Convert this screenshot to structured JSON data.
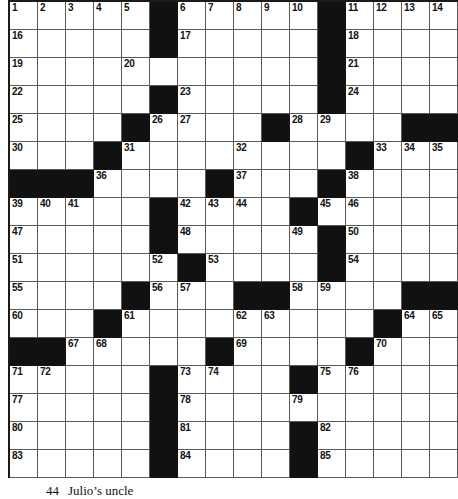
{
  "puzzle": {
    "type": "crossword-grid",
    "columns": 16,
    "rows": 17,
    "cell_px": 28,
    "colors": {
      "block": "#111111",
      "cell": "#ffffff",
      "rule": "#5a5a5a",
      "border": "#1a1a1a",
      "number_text": "#111111"
    },
    "grid": [
      [
        {
          "b": false,
          "n": "1"
        },
        {
          "b": false,
          "n": "2"
        },
        {
          "b": false,
          "n": "3"
        },
        {
          "b": false,
          "n": "4"
        },
        {
          "b": false,
          "n": "5"
        },
        {
          "b": true,
          "n": ""
        },
        {
          "b": false,
          "n": "6"
        },
        {
          "b": false,
          "n": "7"
        },
        {
          "b": false,
          "n": "8"
        },
        {
          "b": false,
          "n": "9"
        },
        {
          "b": false,
          "n": "10"
        },
        {
          "b": true,
          "n": ""
        },
        {
          "b": false,
          "n": "11"
        },
        {
          "b": false,
          "n": "12"
        },
        {
          "b": false,
          "n": "13"
        },
        {
          "b": false,
          "n": "14"
        }
      ],
      [
        {
          "b": false,
          "n": "16"
        },
        {
          "b": false,
          "n": ""
        },
        {
          "b": false,
          "n": ""
        },
        {
          "b": false,
          "n": ""
        },
        {
          "b": false,
          "n": ""
        },
        {
          "b": true,
          "n": ""
        },
        {
          "b": false,
          "n": "17"
        },
        {
          "b": false,
          "n": ""
        },
        {
          "b": false,
          "n": ""
        },
        {
          "b": false,
          "n": ""
        },
        {
          "b": false,
          "n": ""
        },
        {
          "b": true,
          "n": ""
        },
        {
          "b": false,
          "n": "18"
        },
        {
          "b": false,
          "n": ""
        },
        {
          "b": false,
          "n": ""
        },
        {
          "b": false,
          "n": ""
        }
      ],
      [
        {
          "b": false,
          "n": "19"
        },
        {
          "b": false,
          "n": ""
        },
        {
          "b": false,
          "n": ""
        },
        {
          "b": false,
          "n": ""
        },
        {
          "b": false,
          "n": "20"
        },
        {
          "b": false,
          "n": ""
        },
        {
          "b": false,
          "n": ""
        },
        {
          "b": false,
          "n": ""
        },
        {
          "b": false,
          "n": ""
        },
        {
          "b": false,
          "n": ""
        },
        {
          "b": false,
          "n": ""
        },
        {
          "b": true,
          "n": ""
        },
        {
          "b": false,
          "n": "21"
        },
        {
          "b": false,
          "n": ""
        },
        {
          "b": false,
          "n": ""
        },
        {
          "b": false,
          "n": ""
        }
      ],
      [
        {
          "b": false,
          "n": "22"
        },
        {
          "b": false,
          "n": ""
        },
        {
          "b": false,
          "n": ""
        },
        {
          "b": false,
          "n": ""
        },
        {
          "b": false,
          "n": ""
        },
        {
          "b": true,
          "n": ""
        },
        {
          "b": false,
          "n": "23"
        },
        {
          "b": false,
          "n": ""
        },
        {
          "b": false,
          "n": ""
        },
        {
          "b": false,
          "n": ""
        },
        {
          "b": false,
          "n": ""
        },
        {
          "b": true,
          "n": ""
        },
        {
          "b": false,
          "n": "24"
        },
        {
          "b": false,
          "n": ""
        },
        {
          "b": false,
          "n": ""
        },
        {
          "b": false,
          "n": ""
        }
      ],
      [
        {
          "b": false,
          "n": "25"
        },
        {
          "b": false,
          "n": ""
        },
        {
          "b": false,
          "n": ""
        },
        {
          "b": false,
          "n": ""
        },
        {
          "b": true,
          "n": ""
        },
        {
          "b": false,
          "n": "26"
        },
        {
          "b": false,
          "n": "27"
        },
        {
          "b": false,
          "n": ""
        },
        {
          "b": false,
          "n": ""
        },
        {
          "b": true,
          "n": ""
        },
        {
          "b": false,
          "n": "28"
        },
        {
          "b": false,
          "n": "29"
        },
        {
          "b": false,
          "n": ""
        },
        {
          "b": false,
          "n": ""
        },
        {
          "b": true,
          "n": ""
        },
        {
          "b": true,
          "n": ""
        }
      ],
      [
        {
          "b": false,
          "n": "30"
        },
        {
          "b": false,
          "n": ""
        },
        {
          "b": false,
          "n": ""
        },
        {
          "b": true,
          "n": ""
        },
        {
          "b": false,
          "n": "31"
        },
        {
          "b": false,
          "n": ""
        },
        {
          "b": false,
          "n": ""
        },
        {
          "b": false,
          "n": ""
        },
        {
          "b": false,
          "n": "32"
        },
        {
          "b": false,
          "n": ""
        },
        {
          "b": false,
          "n": ""
        },
        {
          "b": false,
          "n": ""
        },
        {
          "b": true,
          "n": ""
        },
        {
          "b": false,
          "n": "33"
        },
        {
          "b": false,
          "n": "34"
        },
        {
          "b": false,
          "n": "35"
        }
      ],
      [
        {
          "b": true,
          "n": ""
        },
        {
          "b": true,
          "n": ""
        },
        {
          "b": true,
          "n": ""
        },
        {
          "b": false,
          "n": "36"
        },
        {
          "b": false,
          "n": ""
        },
        {
          "b": false,
          "n": ""
        },
        {
          "b": false,
          "n": ""
        },
        {
          "b": true,
          "n": ""
        },
        {
          "b": false,
          "n": "37"
        },
        {
          "b": false,
          "n": ""
        },
        {
          "b": false,
          "n": ""
        },
        {
          "b": true,
          "n": ""
        },
        {
          "b": false,
          "n": "38"
        },
        {
          "b": false,
          "n": ""
        },
        {
          "b": false,
          "n": ""
        },
        {
          "b": false,
          "n": ""
        }
      ],
      [
        {
          "b": false,
          "n": "39"
        },
        {
          "b": false,
          "n": "40"
        },
        {
          "b": false,
          "n": "41"
        },
        {
          "b": false,
          "n": ""
        },
        {
          "b": false,
          "n": ""
        },
        {
          "b": true,
          "n": ""
        },
        {
          "b": false,
          "n": "42"
        },
        {
          "b": false,
          "n": "43"
        },
        {
          "b": false,
          "n": "44"
        },
        {
          "b": false,
          "n": ""
        },
        {
          "b": true,
          "n": ""
        },
        {
          "b": false,
          "n": "45"
        },
        {
          "b": false,
          "n": "46"
        },
        {
          "b": false,
          "n": ""
        },
        {
          "b": false,
          "n": ""
        },
        {
          "b": false,
          "n": ""
        }
      ],
      [
        {
          "b": false,
          "n": "47"
        },
        {
          "b": false,
          "n": ""
        },
        {
          "b": false,
          "n": ""
        },
        {
          "b": false,
          "n": ""
        },
        {
          "b": false,
          "n": ""
        },
        {
          "b": true,
          "n": ""
        },
        {
          "b": false,
          "n": "48"
        },
        {
          "b": false,
          "n": ""
        },
        {
          "b": false,
          "n": ""
        },
        {
          "b": false,
          "n": ""
        },
        {
          "b": false,
          "n": "49"
        },
        {
          "b": true,
          "n": ""
        },
        {
          "b": false,
          "n": "50"
        },
        {
          "b": false,
          "n": ""
        },
        {
          "b": false,
          "n": ""
        },
        {
          "b": false,
          "n": ""
        }
      ],
      [
        {
          "b": false,
          "n": "51"
        },
        {
          "b": false,
          "n": ""
        },
        {
          "b": false,
          "n": ""
        },
        {
          "b": false,
          "n": ""
        },
        {
          "b": false,
          "n": ""
        },
        {
          "b": false,
          "n": "52"
        },
        {
          "b": true,
          "n": ""
        },
        {
          "b": false,
          "n": "53"
        },
        {
          "b": false,
          "n": ""
        },
        {
          "b": false,
          "n": ""
        },
        {
          "b": false,
          "n": ""
        },
        {
          "b": true,
          "n": ""
        },
        {
          "b": false,
          "n": "54"
        },
        {
          "b": false,
          "n": ""
        },
        {
          "b": false,
          "n": ""
        },
        {
          "b": false,
          "n": ""
        }
      ],
      [
        {
          "b": false,
          "n": "55"
        },
        {
          "b": false,
          "n": ""
        },
        {
          "b": false,
          "n": ""
        },
        {
          "b": false,
          "n": ""
        },
        {
          "b": true,
          "n": ""
        },
        {
          "b": false,
          "n": "56"
        },
        {
          "b": false,
          "n": "57"
        },
        {
          "b": false,
          "n": ""
        },
        {
          "b": true,
          "n": ""
        },
        {
          "b": true,
          "n": ""
        },
        {
          "b": false,
          "n": "58"
        },
        {
          "b": false,
          "n": "59"
        },
        {
          "b": false,
          "n": ""
        },
        {
          "b": false,
          "n": ""
        },
        {
          "b": true,
          "n": ""
        },
        {
          "b": true,
          "n": ""
        }
      ],
      [
        {
          "b": false,
          "n": "60"
        },
        {
          "b": false,
          "n": ""
        },
        {
          "b": false,
          "n": ""
        },
        {
          "b": true,
          "n": ""
        },
        {
          "b": false,
          "n": "61"
        },
        {
          "b": false,
          "n": ""
        },
        {
          "b": false,
          "n": ""
        },
        {
          "b": false,
          "n": ""
        },
        {
          "b": false,
          "n": "62"
        },
        {
          "b": false,
          "n": "63"
        },
        {
          "b": false,
          "n": ""
        },
        {
          "b": false,
          "n": ""
        },
        {
          "b": false,
          "n": ""
        },
        {
          "b": true,
          "n": ""
        },
        {
          "b": false,
          "n": "64"
        },
        {
          "b": false,
          "n": "65"
        }
      ],
      [
        {
          "b": true,
          "n": ""
        },
        {
          "b": true,
          "n": ""
        },
        {
          "b": false,
          "n": "67"
        },
        {
          "b": false,
          "n": "68"
        },
        {
          "b": false,
          "n": ""
        },
        {
          "b": false,
          "n": ""
        },
        {
          "b": false,
          "n": ""
        },
        {
          "b": true,
          "n": ""
        },
        {
          "b": false,
          "n": "69"
        },
        {
          "b": false,
          "n": ""
        },
        {
          "b": false,
          "n": ""
        },
        {
          "b": false,
          "n": ""
        },
        {
          "b": true,
          "n": ""
        },
        {
          "b": false,
          "n": "70"
        },
        {
          "b": false,
          "n": ""
        },
        {
          "b": false,
          "n": ""
        }
      ],
      [
        {
          "b": false,
          "n": "71"
        },
        {
          "b": false,
          "n": "72"
        },
        {
          "b": false,
          "n": ""
        },
        {
          "b": false,
          "n": ""
        },
        {
          "b": false,
          "n": ""
        },
        {
          "b": true,
          "n": ""
        },
        {
          "b": false,
          "n": "73"
        },
        {
          "b": false,
          "n": "74"
        },
        {
          "b": false,
          "n": ""
        },
        {
          "b": false,
          "n": ""
        },
        {
          "b": true,
          "n": ""
        },
        {
          "b": false,
          "n": "75"
        },
        {
          "b": false,
          "n": "76"
        },
        {
          "b": false,
          "n": ""
        },
        {
          "b": false,
          "n": ""
        },
        {
          "b": false,
          "n": ""
        }
      ],
      [
        {
          "b": false,
          "n": "77"
        },
        {
          "b": false,
          "n": ""
        },
        {
          "b": false,
          "n": ""
        },
        {
          "b": false,
          "n": ""
        },
        {
          "b": false,
          "n": ""
        },
        {
          "b": true,
          "n": ""
        },
        {
          "b": false,
          "n": "78"
        },
        {
          "b": false,
          "n": ""
        },
        {
          "b": false,
          "n": ""
        },
        {
          "b": false,
          "n": ""
        },
        {
          "b": false,
          "n": "79"
        },
        {
          "b": false,
          "n": ""
        },
        {
          "b": false,
          "n": ""
        },
        {
          "b": false,
          "n": ""
        },
        {
          "b": false,
          "n": ""
        },
        {
          "b": false,
          "n": ""
        }
      ],
      [
        {
          "b": false,
          "n": "80"
        },
        {
          "b": false,
          "n": ""
        },
        {
          "b": false,
          "n": ""
        },
        {
          "b": false,
          "n": ""
        },
        {
          "b": false,
          "n": ""
        },
        {
          "b": true,
          "n": ""
        },
        {
          "b": false,
          "n": "81"
        },
        {
          "b": false,
          "n": ""
        },
        {
          "b": false,
          "n": ""
        },
        {
          "b": false,
          "n": ""
        },
        {
          "b": true,
          "n": ""
        },
        {
          "b": false,
          "n": "82"
        },
        {
          "b": false,
          "n": ""
        },
        {
          "b": false,
          "n": ""
        },
        {
          "b": false,
          "n": ""
        },
        {
          "b": false,
          "n": ""
        }
      ],
      [
        {
          "b": false,
          "n": "83"
        },
        {
          "b": false,
          "n": ""
        },
        {
          "b": false,
          "n": ""
        },
        {
          "b": false,
          "n": ""
        },
        {
          "b": false,
          "n": ""
        },
        {
          "b": true,
          "n": ""
        },
        {
          "b": false,
          "n": "84"
        },
        {
          "b": false,
          "n": ""
        },
        {
          "b": false,
          "n": ""
        },
        {
          "b": false,
          "n": ""
        },
        {
          "b": true,
          "n": ""
        },
        {
          "b": false,
          "n": "85"
        },
        {
          "b": false,
          "n": ""
        },
        {
          "b": false,
          "n": ""
        },
        {
          "b": false,
          "n": ""
        },
        {
          "b": false,
          "n": ""
        }
      ]
    ]
  },
  "clues": {
    "visible": [
      {
        "number": "44",
        "text": "Julio’s uncle"
      }
    ]
  }
}
